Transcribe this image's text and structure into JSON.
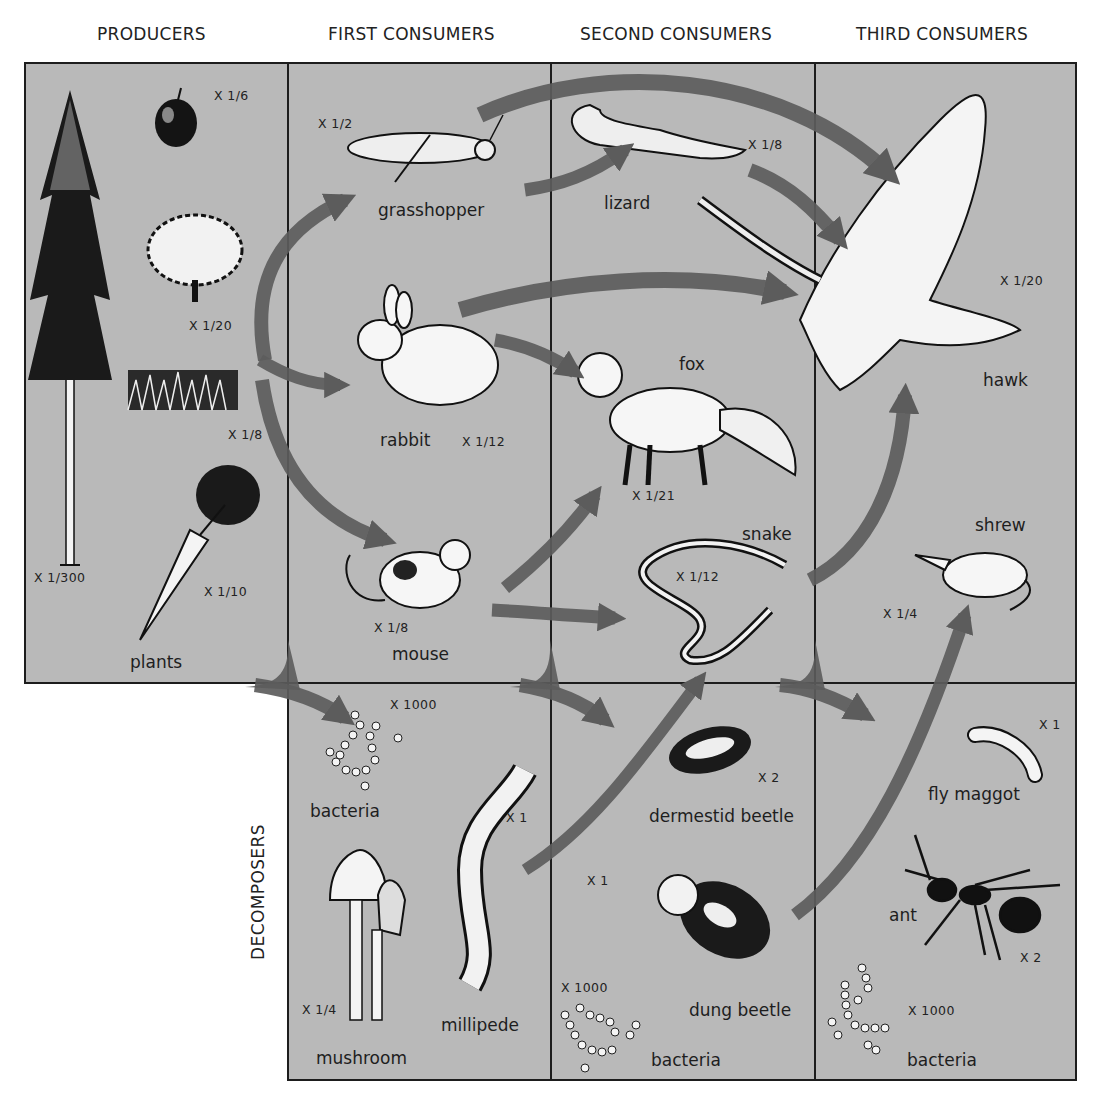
{
  "columns": {
    "producers": "PRODUCERS",
    "first": "FIRST CONSUMERS",
    "second": "SECOND CONSUMERS",
    "third": "THIRD CONSUMERS"
  },
  "row_label": "DECOMPOSERS",
  "colors": {
    "panel": "#b9b9b9",
    "arrow": "#5c5c5c",
    "border": "#1d1d1d",
    "background": "#ffffff"
  },
  "producers": {
    "tree": {
      "scale": "X 1/300"
    },
    "apple": {
      "scale": "X 1/6"
    },
    "shrub": {
      "scale": "X 1/20"
    },
    "grass": {
      "scale": "X 1/8"
    },
    "carrot": {
      "scale": "X 1/10"
    },
    "label": "plants"
  },
  "first_consumers": {
    "grasshopper": {
      "label": "grasshopper",
      "scale": "X 1/2"
    },
    "rabbit": {
      "label": "rabbit",
      "scale": "X 1/12"
    },
    "mouse": {
      "label": "mouse",
      "scale": "X 1/8"
    }
  },
  "second_consumers": {
    "lizard": {
      "label": "lizard",
      "scale": "X 1/8"
    },
    "fox": {
      "label": "fox",
      "scale": "X 1/21"
    },
    "snake": {
      "label": "snake",
      "scale": "X 1/12"
    }
  },
  "third_consumers": {
    "hawk": {
      "label": "hawk",
      "scale": "X 1/20"
    },
    "shrew": {
      "label": "shrew",
      "scale": "X 1/4"
    }
  },
  "decomposers": {
    "col1": {
      "bacteria": {
        "label": "bacteria",
        "scale": "X 1000"
      },
      "millipede": {
        "label": "millipede",
        "scale": "X 1"
      },
      "mushroom": {
        "label": "mushroom",
        "scale": "X 1/4"
      }
    },
    "col2": {
      "dermestid": {
        "label": "dermestid beetle",
        "scale": "X 2"
      },
      "dung": {
        "label": "dung beetle",
        "scale": "X 1"
      },
      "bacteria": {
        "label": "bacteria",
        "scale": "X 1000"
      }
    },
    "col3": {
      "maggot": {
        "label": "fly maggot",
        "scale": "X 1"
      },
      "ant": {
        "label": "ant",
        "scale": "X 2"
      },
      "bacteria": {
        "label": "bacteria",
        "scale": "X 1000"
      }
    }
  }
}
